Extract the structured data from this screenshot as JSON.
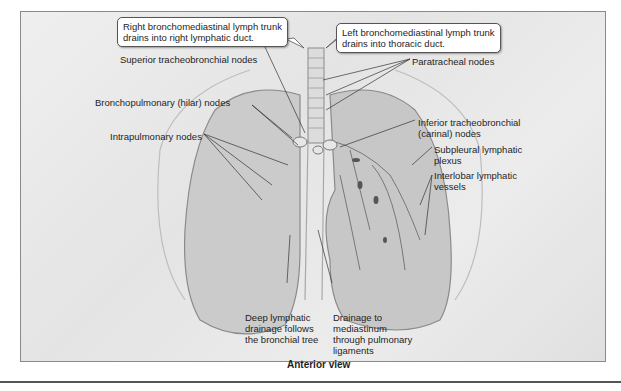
{
  "figure": {
    "caption": "Anterior view",
    "callouts": {
      "right": "Right bronchomediastinal lymph trunk\ndrains into right lymphatic duct.",
      "left": "Left bronchomediastinal lymph trunk\ndrains into thoracic duct."
    },
    "labels": {
      "superior_tracheobronchial": "Superior tracheobronchial nodes",
      "paratracheal": "Paratracheal nodes",
      "bronchopulmonary": "Bronchopulmonary (hilar) nodes",
      "intrapulmonary": "Intrapulmonary nodes",
      "inferior_tracheobronchial": "Inferior tracheobronchial\n(carinal) nodes",
      "subpleural": "Subpleural lymphatic\nplexus",
      "interlobar": "Interlobar lymphatic\nvessels",
      "deep_drainage": "Deep lymphatic\ndrainage follows\nthe bronchial tree",
      "mediastinum_drainage": "Drainage to\nmediastinum\nthrough pulmonary\nligaments"
    },
    "colors": {
      "background": "#e8e8e8",
      "lung_fill": "#c9c9c9",
      "outline": "#8a8a8a",
      "text": "#1e1e1e"
    }
  }
}
